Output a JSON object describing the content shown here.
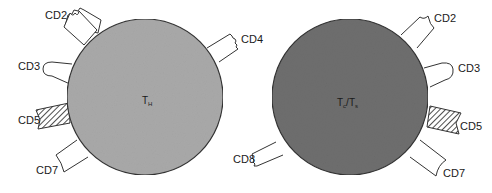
{
  "diagram": {
    "cells": [
      {
        "id": "helper",
        "label_main": "T",
        "label_sub": "H",
        "fill": "#a9a9a9",
        "markers": [
          "CD2",
          "CD3",
          "CD4",
          "CD5",
          "CD7"
        ]
      },
      {
        "id": "cytotoxic-suppressor",
        "label_main": "T",
        "label_sub": "c",
        "label_sep": "/",
        "label_main2": "T",
        "label_sub2": "s",
        "fill": "#6e6e6e",
        "markers": [
          "CD2",
          "CD3",
          "CD5",
          "CD7",
          "CD8"
        ]
      }
    ],
    "labels": {
      "left_cd2": "CD2",
      "left_cd3": "CD3",
      "left_cd4": "CD4",
      "left_cd5": "CD5",
      "left_cd7": "CD7",
      "right_cd2": "CD2",
      "right_cd3": "CD3",
      "right_cd5": "CD5",
      "right_cd7": "CD7",
      "right_cd8": "CD8"
    }
  }
}
